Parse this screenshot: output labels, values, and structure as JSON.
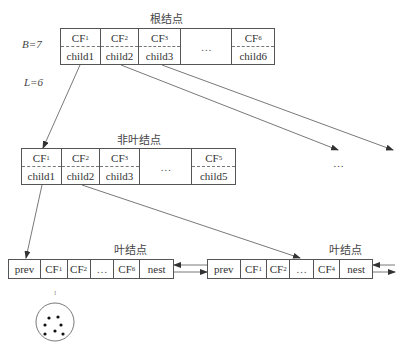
{
  "params": {
    "b": "B=7",
    "l": "L=6"
  },
  "root": {
    "title": "根结点",
    "cells": [
      {
        "cf": "CF",
        "sub": "1",
        "child": "child1"
      },
      {
        "cf": "CF",
        "sub": "2",
        "child": "child2"
      },
      {
        "cf": "CF",
        "sub": "3",
        "child": "child3"
      },
      {
        "ellipsis": "…"
      },
      {
        "cf": "CF",
        "sub": "6",
        "child": "child6"
      }
    ]
  },
  "nonleaf": {
    "title": "非叶结点",
    "cells": [
      {
        "cf": "CF",
        "sub": "1",
        "child": "child1"
      },
      {
        "cf": "CF",
        "sub": "2",
        "child": "child2"
      },
      {
        "cf": "CF",
        "sub": "3",
        "child": "child3"
      },
      {
        "ellipsis": "…"
      },
      {
        "cf": "CF",
        "sub": "5",
        "child": "child5"
      }
    ]
  },
  "leaf1": {
    "title": "叶结点",
    "cells": [
      "prev",
      "CF1",
      "CF2",
      "…",
      "CF6",
      "nest"
    ],
    "prev": "prev",
    "cf1": "CF",
    "cf1_sub": "1",
    "cf2": "CF",
    "cf2_sub": "2",
    "ellipsis": "…",
    "cfn": "CF",
    "cfn_sub": "6",
    "next": "nest"
  },
  "leaf2": {
    "title": "叶结点",
    "prev": "prev",
    "cf1": "CF",
    "cf1_sub": "1",
    "cf2": "CF",
    "cf2_sub": "2",
    "ellipsis": "…",
    "cfn": "CF",
    "cfn_sub": "4",
    "next": "nest"
  },
  "side_ellipsis": "…",
  "cluster_mark": "I"
}
